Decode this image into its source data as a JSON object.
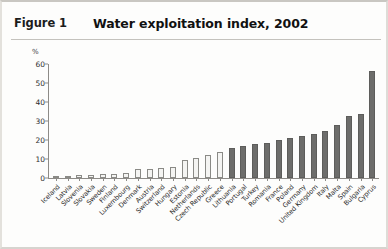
{
  "header": {
    "figure_label": "Figure 1",
    "title": "Water exploitation index, 2002"
  },
  "chart_data": {
    "type": "bar",
    "title": "Water exploitation index, 2002",
    "xlabel": "",
    "ylabel": "%",
    "unit_label": "%",
    "ylim": [
      0,
      60
    ],
    "yticks": [
      0,
      10,
      20,
      30,
      40,
      50,
      60
    ],
    "grid": false,
    "legend": "none",
    "categories": [
      "Iceland",
      "Latvia",
      "Slovenia",
      "Slovakia",
      "Sweden",
      "Finland",
      "Luxembourg",
      "Denmark",
      "Austria",
      "Switzerland",
      "Hungary",
      "Estonia",
      "Netherlands",
      "Czech Republic",
      "Greece",
      "Lithuania",
      "Portugal",
      "Turkey",
      "Romania",
      "France",
      "Poland",
      "Germany",
      "United Kingdom",
      "Italy",
      "Malta",
      "Spain",
      "Bulgaria",
      "Cyprus"
    ],
    "values": [
      0.3,
      1.0,
      1.5,
      1.8,
      2.0,
      2.2,
      2.5,
      4.5,
      5.0,
      5.5,
      6.0,
      9.5,
      10.5,
      12.0,
      13.5,
      16.0,
      17.0,
      18.0,
      18.5,
      20.0,
      21.0,
      22.0,
      23.0,
      24.5,
      28.0,
      32.5,
      33.5,
      56.5
    ],
    "bar_styles": [
      "light",
      "light",
      "light",
      "light",
      "light",
      "light",
      "light",
      "light",
      "light",
      "light",
      "light",
      "light",
      "light",
      "light",
      "light",
      "dark",
      "dark",
      "dark",
      "dark",
      "dark",
      "dark",
      "dark",
      "dark",
      "dark",
      "dark",
      "dark",
      "dark",
      "dark"
    ],
    "colors": {
      "light_bar_fill": "#f4f4f2",
      "light_bar_border": "#8a8a86",
      "dark_bar_fill": "#6d6d6b",
      "dark_bar_border": "#5d5d5b",
      "axis": "#8d8b87",
      "text": "#2b2b2b"
    }
  }
}
